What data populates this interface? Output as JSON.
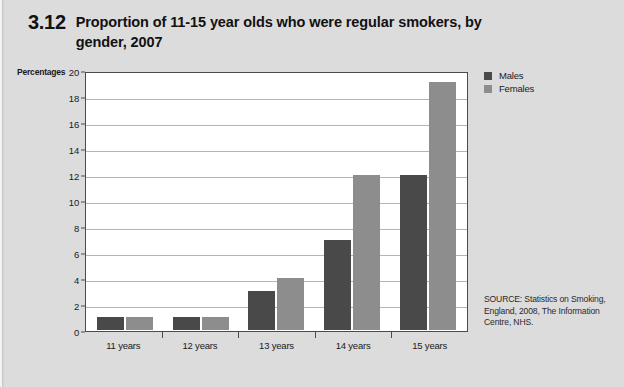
{
  "figure": {
    "number": "3.12",
    "title": "Proportion of 11-15 year olds who were regular smokers, by gender, 2007",
    "next_figure_number": "3.13"
  },
  "axis_unit_label": "Percentages",
  "source_note": "SOURCE: Statistics on Smoking, England, 2008, The Information Centre, NHS.",
  "colors": {
    "males": "#494949",
    "females": "#8d8d8d",
    "page_background": "#dcdcdc",
    "plot_background": "#ffffff",
    "gridline": "#b4b4b4",
    "axis": "#4b4b4b"
  },
  "legend": {
    "position": "top-right",
    "items": [
      {
        "label": "Males",
        "color": "#494949"
      },
      {
        "label": "Females",
        "color": "#8d8d8d"
      }
    ]
  },
  "chart_data": {
    "type": "bar",
    "title": "Proportion of 11-15 year olds who were regular smokers, by gender, 2007",
    "subtitle": "",
    "xlabel": "",
    "ylabel": "Percentages",
    "categories": [
      "11 years",
      "12 years",
      "13 years",
      "14 years",
      "15 years"
    ],
    "series": [
      {
        "name": "Males",
        "values": [
          1,
          1,
          3,
          7,
          12
        ]
      },
      {
        "name": "Females",
        "values": [
          1,
          1,
          4,
          12,
          19.3
        ]
      }
    ],
    "ylim": [
      0,
      20
    ],
    "yticks": [
      0,
      2,
      4,
      6,
      8,
      10,
      12,
      14,
      16,
      18,
      20
    ],
    "ytick_labels": [
      "0",
      "2",
      "4",
      "6",
      "8",
      "10",
      "12",
      "14",
      "16",
      "18",
      "20"
    ],
    "grid": true,
    "grid_axis": "y",
    "legend_position": "top-right"
  }
}
